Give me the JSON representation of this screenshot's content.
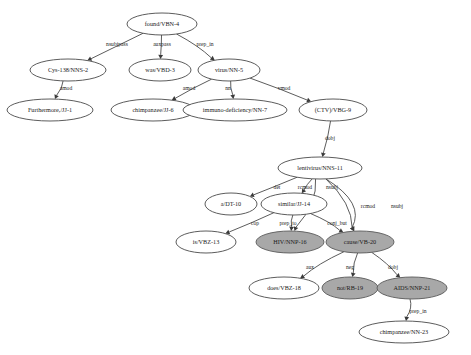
{
  "figure": {
    "type": "dependency-parse-graph",
    "background_color": "#ffffff",
    "node_fill_plain": "#ffffff",
    "node_fill_highlight": "#a8a8a8",
    "edge_color": "#4a4a4a",
    "text_color": "#1a1a1a"
  },
  "nodes": [
    {
      "id": "n4",
      "label": "found/VBN-4",
      "x": 162,
      "y": 24,
      "rx": 35,
      "ry": 11,
      "highlight": false,
      "font_size": 6.2
    },
    {
      "id": "n2",
      "label": "Cys-138/NNS-2",
      "x": 68,
      "y": 70,
      "rx": 38,
      "ry": 11,
      "highlight": false,
      "font_size": 6.2
    },
    {
      "id": "n3",
      "label": "was/VBD-3",
      "x": 160,
      "y": 70,
      "rx": 31,
      "ry": 11,
      "highlight": false,
      "font_size": 6.2
    },
    {
      "id": "n5",
      "label": "virus/NN-5",
      "x": 229,
      "y": 70,
      "rx": 31,
      "ry": 11,
      "highlight": false,
      "font_size": 6.2
    },
    {
      "id": "n1",
      "label": "Furthermore,/JJ-1",
      "x": 50,
      "y": 110,
      "rx": 43,
      "ry": 11,
      "highlight": false,
      "font_size": 6.2
    },
    {
      "id": "n6",
      "label": "chimpanzee/JJ-6",
      "x": 153,
      "y": 110,
      "rx": 42,
      "ry": 11,
      "highlight": false,
      "font_size": 6.2
    },
    {
      "id": "n7",
      "label": "immuno-deficiency/NN-7",
      "x": 235,
      "y": 110,
      "rx": 52,
      "ry": 11,
      "highlight": false,
      "font_size": 6.2
    },
    {
      "id": "n9",
      "label": "(CTV)/VBG-9",
      "x": 333,
      "y": 110,
      "rx": 34,
      "ry": 11,
      "highlight": false,
      "font_size": 6.2
    },
    {
      "id": "n11",
      "label": "lentivirus/NNS-11",
      "x": 320,
      "y": 168,
      "rx": 42,
      "ry": 11,
      "highlight": false,
      "font_size": 6.2
    },
    {
      "id": "n10",
      "label": "a/DT-10",
      "x": 231,
      "y": 204,
      "rx": 26,
      "ry": 11,
      "highlight": false,
      "font_size": 6.2
    },
    {
      "id": "n14",
      "label": "similar/JJ-14",
      "x": 294,
      "y": 204,
      "rx": 33,
      "ry": 11,
      "highlight": false,
      "font_size": 6.2
    },
    {
      "id": "n13",
      "label": "is/VBZ-13",
      "x": 206,
      "y": 242,
      "rx": 30,
      "ry": 11,
      "highlight": false,
      "font_size": 6.2
    },
    {
      "id": "n16",
      "label": "HIV/NNP-16",
      "x": 290,
      "y": 242,
      "rx": 34,
      "ry": 11,
      "highlight": true,
      "font_size": 6.2
    },
    {
      "id": "n20",
      "label": "cause/VB-20",
      "x": 360,
      "y": 242,
      "rx": 34,
      "ry": 11,
      "highlight": true,
      "font_size": 6.2
    },
    {
      "id": "n18",
      "label": "does/VBZ-18",
      "x": 284,
      "y": 288,
      "rx": 35,
      "ry": 11,
      "highlight": false,
      "font_size": 6.2
    },
    {
      "id": "n19",
      "label": "not/RB-19",
      "x": 350,
      "y": 288,
      "rx": 28,
      "ry": 11,
      "highlight": true,
      "font_size": 6.2
    },
    {
      "id": "n21",
      "label": "AIDS/NNP-21",
      "x": 412,
      "y": 288,
      "rx": 35,
      "ry": 11,
      "highlight": true,
      "font_size": 6.2
    },
    {
      "id": "n23",
      "label": "chimpanzee/NN-23",
      "x": 404,
      "y": 332,
      "rx": 45,
      "ry": 11,
      "highlight": false,
      "font_size": 6.2
    }
  ],
  "edges": [
    {
      "from": "n4",
      "to": "n2",
      "label": "nsubjpass",
      "label_x": 117,
      "label_y": 45
    },
    {
      "from": "n4",
      "to": "n3",
      "label": "auxpass",
      "label_x": 162,
      "label_y": 45
    },
    {
      "from": "n4",
      "to": "n5",
      "label": "prep_in",
      "label_x": 205,
      "label_y": 45
    },
    {
      "from": "n2",
      "to": "n1",
      "label": "amod",
      "label_x": 66,
      "label_y": 89
    },
    {
      "from": "n5",
      "to": "n6",
      "label": "amod",
      "label_x": 189,
      "label_y": 89
    },
    {
      "from": "n5",
      "to": "n7",
      "label": "nn",
      "label_x": 228,
      "label_y": 89
    },
    {
      "from": "n5",
      "to": "n9",
      "label": "vmod",
      "label_x": 284,
      "label_y": 89
    },
    {
      "from": "n9",
      "to": "n11",
      "label": "dobj",
      "label_x": 330,
      "label_y": 139
    },
    {
      "from": "n11",
      "to": "n10",
      "label": "det",
      "label_x": 277,
      "label_y": 188
    },
    {
      "from": "n11",
      "to": "n14",
      "label": "rcmod",
      "label_x": 305,
      "label_y": 188
    },
    {
      "from": "n11",
      "to": "n16",
      "label": "nsubj",
      "label_x": 332,
      "label_y": 188
    },
    {
      "from": "n11",
      "to": "n20",
      "label": "rcmod",
      "label_x": 368,
      "label_y": 207
    },
    {
      "from": "n11",
      "to": "n20",
      "label": "nsubj",
      "label_x": 397,
      "label_y": 207
    },
    {
      "from": "n14",
      "to": "n13",
      "label": "cop",
      "label_x": 255,
      "label_y": 224
    },
    {
      "from": "n14",
      "to": "n16",
      "label": "prep_to",
      "label_x": 288,
      "label_y": 224
    },
    {
      "from": "n14",
      "to": "n20",
      "label": "conj_but",
      "label_x": 337,
      "label_y": 224
    },
    {
      "from": "n20",
      "to": "n18",
      "label": "aux",
      "label_x": 310,
      "label_y": 268
    },
    {
      "from": "n20",
      "to": "n19",
      "label": "neg",
      "label_x": 350,
      "label_y": 268
    },
    {
      "from": "n20",
      "to": "n21",
      "label": "dobj",
      "label_x": 393,
      "label_y": 268
    },
    {
      "from": "n21",
      "to": "n23",
      "label": "prep_in",
      "label_x": 418,
      "label_y": 312
    }
  ]
}
